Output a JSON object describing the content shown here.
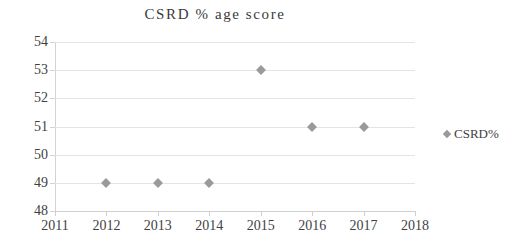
{
  "chart_data": {
    "type": "scatter",
    "title": "CSRD % age score",
    "xlabel": "",
    "ylabel": "",
    "xlim": [
      2011,
      2018
    ],
    "ylim": [
      48,
      54
    ],
    "grid": true,
    "legend_position": "right",
    "x_tick_labels": [
      "2011",
      "2012",
      "2013",
      "2014",
      "2015",
      "2016",
      "2017",
      "2018"
    ],
    "y_tick_labels": [
      "48",
      "49",
      "50",
      "51",
      "52",
      "53",
      "54"
    ],
    "series": [
      {
        "name": "CSRD%",
        "marker": "diamond",
        "color": "#9a9a9a",
        "x": [
          2012,
          2013,
          2014,
          2015,
          2016,
          2017
        ],
        "values": [
          49,
          49,
          49,
          53,
          51,
          51
        ],
        "points": [
          {
            "x": 2012,
            "y": 49
          },
          {
            "x": 2013,
            "y": 49
          },
          {
            "x": 2014,
            "y": 49
          },
          {
            "x": 2015,
            "y": 53
          },
          {
            "x": 2016,
            "y": 51
          },
          {
            "x": 2017,
            "y": 51
          }
        ]
      }
    ]
  },
  "legend": {
    "entries": [
      {
        "label": "CSRD%",
        "color": "#9a9a9a"
      }
    ]
  },
  "colors": {
    "marker": "#9a9a9a",
    "gridline": "#e4e4e4",
    "axis": "#cfcfcf",
    "text": "#3f3f3f",
    "background": "#ffffff"
  }
}
